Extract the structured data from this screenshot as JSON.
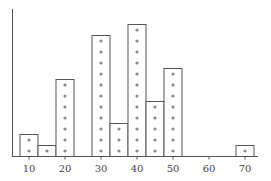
{
  "chart_data": {
    "type": "bar",
    "subtype": "dot-histogram",
    "title": "",
    "xlabel": "",
    "ylabel": "",
    "bin_width": 5,
    "categories": [
      10,
      15,
      20,
      25,
      30,
      35,
      40,
      45,
      50,
      55,
      60,
      65,
      70
    ],
    "values": [
      2,
      1,
      7,
      0,
      11,
      3,
      12,
      5,
      8,
      0,
      0,
      0,
      1
    ],
    "x_ticks": [
      10,
      20,
      30,
      40,
      50,
      60,
      70
    ],
    "xlim": [
      5,
      75
    ],
    "ylim": [
      0,
      12
    ],
    "grid": false,
    "legend": null
  },
  "colors": {
    "axis": "#555555",
    "bar_stroke": "#555555",
    "bar_fill": "#ffffff",
    "dot": "#888888"
  }
}
